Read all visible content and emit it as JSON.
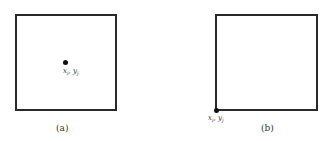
{
  "figures": [
    {
      "caption": "(a)",
      "point_label": {
        "x_var": "x",
        "x_sub": "i",
        "sep": ", ",
        "y_var": "y",
        "y_sub": "j"
      },
      "point_position": "center"
    },
    {
      "caption": "(b)",
      "point_label": {
        "x_var": "x",
        "x_sub": "i",
        "sep": ", ",
        "y_var": "y",
        "y_sub": "j"
      },
      "point_position": "bottom-left corner"
    }
  ]
}
